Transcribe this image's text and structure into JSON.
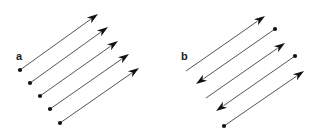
{
  "panels": [
    {
      "label": "a",
      "label_pos": [
        16,
        58
      ],
      "description": "Five parallel arrows all pointing the same direction (up-right)",
      "arrows": [
        {
          "tail": [
            20,
            70
          ],
          "head": [
            98,
            14
          ]
        },
        {
          "tail": [
            30,
            83
          ],
          "head": [
            108,
            27
          ]
        },
        {
          "tail": [
            40,
            96
          ],
          "head": [
            118,
            41
          ]
        },
        {
          "tail": [
            50,
            109
          ],
          "head": [
            129,
            54
          ]
        },
        {
          "tail": [
            60,
            123
          ],
          "head": [
            139,
            68
          ]
        }
      ]
    },
    {
      "label": "b",
      "label_pos": [
        181,
        58
      ],
      "description": "Five parallel arrows alternating directions",
      "arrows": [
        {
          "tail": [
            186,
            71
          ],
          "head": [
            265,
            16
          ],
          "tail_dot": false
        },
        {
          "tail": [
            275,
            29
          ],
          "head": [
            196,
            84
          ],
          "tail_dot": true
        },
        {
          "tail": [
            206,
            98
          ],
          "head": [
            285,
            43
          ],
          "tail_dot": false
        },
        {
          "tail": [
            295,
            56
          ],
          "head": [
            216,
            111
          ],
          "tail_dot": true
        },
        {
          "tail": [
            224,
            126
          ],
          "head": [
            304,
            71
          ],
          "tail_dot": true
        }
      ]
    }
  ],
  "colors": {
    "line": "#555555",
    "head": "#111111",
    "dot": "#111111"
  }
}
